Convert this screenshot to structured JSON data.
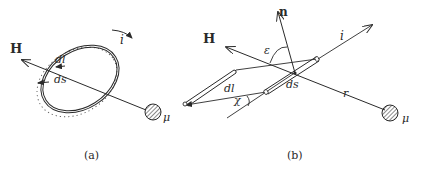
{
  "panels": [
    {
      "id": "a",
      "caption": "(a)",
      "labels": {
        "field": "H",
        "current": "i",
        "element_length": "dl",
        "element_area": "ds",
        "moment": "μ"
      }
    },
    {
      "id": "b",
      "caption": "(b)",
      "labels": {
        "field": "H",
        "normal": "n",
        "current": "i",
        "angle_eps": "ε",
        "angle_chi": "χ",
        "element_length": "dl",
        "element_area": "ds",
        "distance": "r",
        "moment": "μ"
      }
    }
  ],
  "colors": {
    "stroke": "#2a2a2a",
    "background": "#ffffff"
  }
}
